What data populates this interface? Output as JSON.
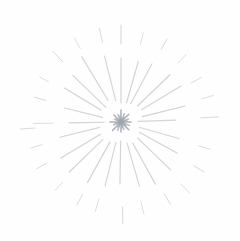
{
  "scene": {
    "description": "Light gray pencil-sketch starburst: dense asterisk core with radiating rays and outer dashes on a white background",
    "background_color": "#fefefe",
    "ray_color": "#a9aeb6",
    "core_color": "#989ea7",
    "core_dot_color": "#a3a8af"
  },
  "starburst": {
    "center": {
      "x": 121,
      "y": 122
    },
    "widths": {
      "main": 1.15,
      "dash": 1.0,
      "core": 1.5
    },
    "core_dot": {
      "r": 2.0,
      "opacity": 0.75
    },
    "core_rays": [
      [
        0,
        1,
        10,
        0.8
      ],
      [
        22,
        1,
        8,
        0.7
      ],
      [
        45,
        1,
        11,
        0.8
      ],
      [
        68,
        1,
        9,
        0.7
      ],
      [
        90,
        1,
        12,
        0.8
      ],
      [
        112,
        1,
        8,
        0.7
      ],
      [
        135,
        1,
        10,
        0.8
      ],
      [
        158,
        1,
        7,
        0.7
      ],
      [
        180,
        1,
        11,
        0.8
      ],
      [
        202,
        1,
        8,
        0.7
      ],
      [
        225,
        1,
        12,
        0.8
      ],
      [
        248,
        1,
        9,
        0.7
      ],
      [
        270,
        1,
        10,
        0.8
      ],
      [
        292,
        1,
        8,
        0.7
      ],
      [
        315,
        1,
        11,
        0.8
      ],
      [
        338,
        1,
        9,
        0.7
      ],
      [
        11,
        1,
        6,
        0.6
      ],
      [
        56,
        1,
        6,
        0.6
      ],
      [
        101,
        1,
        6,
        0.6
      ],
      [
        146,
        1,
        6,
        0.6
      ],
      [
        191,
        1,
        6,
        0.6
      ],
      [
        236,
        1,
        6,
        0.6
      ],
      [
        281,
        1,
        6,
        0.6
      ],
      [
        326,
        1,
        6,
        0.6
      ]
    ],
    "main_rays": [
      [
        2,
        17,
        55,
        0.5
      ],
      [
        14,
        22,
        66,
        0.55
      ],
      [
        31,
        24,
        70,
        0.5
      ],
      [
        44,
        23,
        68,
        0.55
      ],
      [
        62,
        21,
        66,
        0.5
      ],
      [
        74,
        20,
        63,
        0.55
      ],
      [
        90,
        19,
        64,
        0.55
      ],
      [
        104,
        22,
        68,
        0.5
      ],
      [
        121,
        25,
        76,
        0.5
      ],
      [
        136,
        21,
        67,
        0.5
      ],
      [
        149,
        23,
        66,
        0.55
      ],
      [
        166,
        19,
        58,
        0.5
      ],
      [
        181,
        17,
        52,
        0.55
      ],
      [
        194,
        22,
        63,
        0.5
      ],
      [
        211,
        24,
        70,
        0.55
      ],
      [
        224,
        25,
        72,
        0.5
      ],
      [
        241,
        23,
        69,
        0.55
      ],
      [
        256,
        21,
        66,
        0.5
      ],
      [
        269,
        19,
        62,
        0.55
      ],
      [
        286,
        22,
        67,
        0.5
      ],
      [
        299,
        24,
        71,
        0.55
      ],
      [
        316,
        23,
        69,
        0.5
      ],
      [
        331,
        21,
        64,
        0.55
      ],
      [
        344,
        19,
        60,
        0.5
      ]
    ],
    "outer_dashes": [
      [
        3,
        80,
        98,
        0.45
      ],
      [
        16,
        84,
        96,
        0.4
      ],
      [
        29,
        80,
        92,
        0.45
      ],
      [
        46,
        82,
        94,
        0.4
      ],
      [
        61,
        83,
        95,
        0.45
      ],
      [
        76,
        80,
        92,
        0.4
      ],
      [
        90,
        78,
        97,
        0.5
      ],
      [
        103,
        82,
        96,
        0.45
      ],
      [
        119,
        84,
        96,
        0.4
      ],
      [
        134,
        84,
        98,
        0.45
      ],
      [
        151,
        83,
        93,
        0.4
      ],
      [
        164,
        78,
        90,
        0.45
      ],
      [
        184,
        86,
        101,
        0.45
      ],
      [
        181,
        68,
        88,
        0.4
      ],
      [
        196,
        82,
        94,
        0.4
      ],
      [
        209,
        85,
        96,
        0.45
      ],
      [
        226,
        84,
        95,
        0.4
      ],
      [
        242,
        82,
        94,
        0.45
      ],
      [
        254,
        80,
        93,
        0.4
      ],
      [
        271,
        85,
        102,
        0.45
      ],
      [
        284,
        82,
        95,
        0.4
      ],
      [
        301,
        84,
        96,
        0.45
      ],
      [
        314,
        86,
        99,
        0.4
      ],
      [
        329,
        85,
        97,
        0.45
      ],
      [
        343,
        81,
        93,
        0.4
      ]
    ]
  }
}
